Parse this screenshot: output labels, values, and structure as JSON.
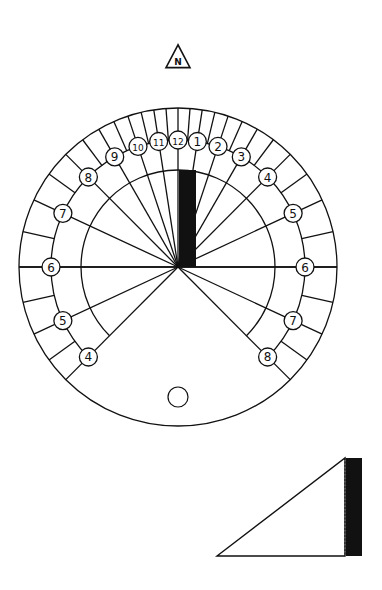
{
  "north_marker": {
    "label": "N",
    "cx": 178,
    "cy": 58,
    "size": 24
  },
  "colors": {
    "ink": "#111111",
    "background": "#ffffff"
  },
  "dial": {
    "cx": 178,
    "cy": 267,
    "outer_radius": 159,
    "number_track_radius": 127,
    "inner_radius": 97,
    "sine_latitude": 0.575,
    "hours": [
      {
        "label": "4",
        "offset": -8
      },
      {
        "label": "5",
        "offset": -7
      },
      {
        "label": "6",
        "offset": -6
      },
      {
        "label": "7",
        "offset": -5
      },
      {
        "label": "8",
        "offset": -4
      },
      {
        "label": "9",
        "offset": -3
      },
      {
        "label": "10",
        "offset": -2
      },
      {
        "label": "11",
        "offset": -1
      },
      {
        "label": "12",
        "offset": 0
      },
      {
        "label": "1",
        "offset": 1
      },
      {
        "label": "2",
        "offset": 2
      },
      {
        "label": "3",
        "offset": 3
      },
      {
        "label": "4",
        "offset": 4
      },
      {
        "label": "5",
        "offset": 5
      },
      {
        "label": "6",
        "offset": 6
      },
      {
        "label": "7",
        "offset": 7
      },
      {
        "label": "8",
        "offset": 8
      }
    ],
    "gnomon_bar": {
      "x": 179,
      "y": 170,
      "width": 17,
      "height": 97
    },
    "hole": {
      "cx": 178,
      "cy": 397,
      "r": 10
    }
  },
  "gnomon_side_view": {
    "points": [
      [
        217,
        556
      ],
      [
        345,
        458
      ],
      [
        345,
        556
      ]
    ],
    "bar": {
      "x": 346,
      "y": 458,
      "width": 16,
      "height": 98
    }
  }
}
